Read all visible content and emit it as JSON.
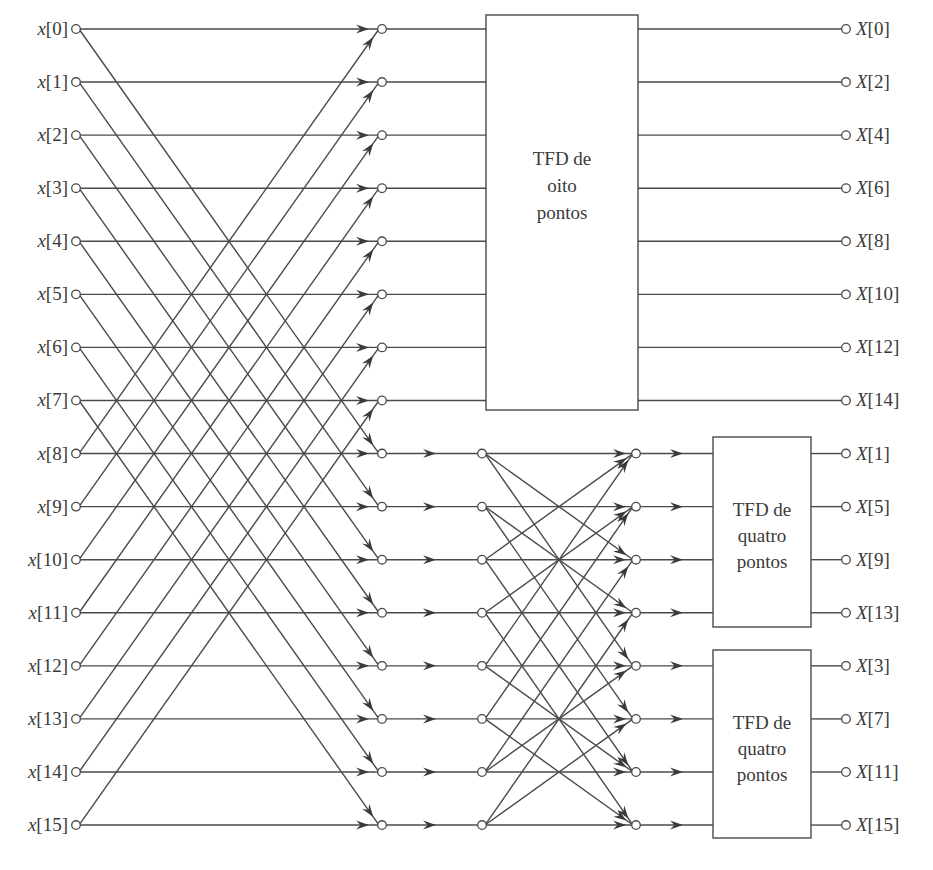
{
  "diagram": {
    "title": "",
    "type": "decimation-in-frequency FFT flow graph (16-point)",
    "inputs": [
      "x[0]",
      "x[1]",
      "x[2]",
      "x[3]",
      "x[4]",
      "x[5]",
      "x[6]",
      "x[7]",
      "x[8]",
      "x[9]",
      "x[10]",
      "x[11]",
      "x[12]",
      "x[13]",
      "x[14]",
      "x[15]"
    ],
    "outputs": [
      "X[0]",
      "X[2]",
      "X[4]",
      "X[6]",
      "X[8]",
      "X[10]",
      "X[12]",
      "X[14]",
      "X[1]",
      "X[5]",
      "X[9]",
      "X[13]",
      "X[3]",
      "X[7]",
      "X[11]",
      "X[15]"
    ],
    "blocks": [
      {
        "id": "dft8",
        "lines": [
          "TFD de",
          "oito",
          "pontos"
        ],
        "rows": [
          0,
          7
        ]
      },
      {
        "id": "dft4a",
        "lines": [
          "TFD de",
          "quatro",
          "pontos"
        ],
        "rows": [
          8,
          11
        ]
      },
      {
        "id": "dft4b",
        "lines": [
          "TFD de",
          "quatro",
          "pontos"
        ],
        "rows": [
          12,
          15
        ]
      }
    ],
    "colors": {
      "line": "#4a4a4a",
      "text": "#3a3a3a",
      "background": "#ffffff"
    }
  }
}
